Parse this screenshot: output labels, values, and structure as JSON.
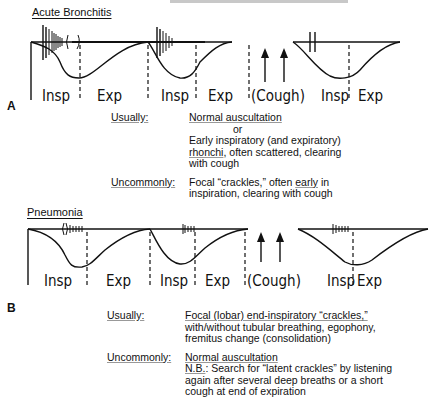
{
  "panelA": {
    "letter": "A",
    "title": "Acute Bronchitis",
    "phases": [
      "Insp",
      "Exp",
      "Insp",
      "Exp",
      "(Cough)",
      "Insp",
      "Exp"
    ],
    "usually_label": "Usually:",
    "usually_line1": "Normal auscultation",
    "usually_or": "or",
    "usually_line2": "Early inspiratory (and expiratory)",
    "usually_line3a": "rhonchi",
    "usually_line3b": ", often scattered, clearing",
    "usually_line4": "with cough",
    "uncommonly_label": "Uncommonly:",
    "uncommonly_line1a": "Focal “crackles,” often ",
    "uncommonly_line1b": "early",
    "uncommonly_line1c": " in",
    "uncommonly_line2": "inspiration, clearing with cough"
  },
  "panelB": {
    "letter": "B",
    "title": "Pneumonia",
    "phases": [
      "Insp",
      "Exp",
      "Insp",
      "Exp",
      "(Cough)",
      "Insp",
      "Exp"
    ],
    "usually_label": "Usually:",
    "usually_line1": "Focal (lobar) end-inspiratory “crackles,”",
    "usually_line2": "with/without tubular breathing, egophony,",
    "usually_line3": "fremitus change (consolidation)",
    "uncommonly_label": "Uncommonly:",
    "uncommonly_line1": "Normal auscultation",
    "uncommonly_line2a": "N.B.",
    "uncommonly_line2b": ": Search for “latent crackles” by listening",
    "uncommonly_line3": "again after several deep breaths or a short",
    "uncommonly_line4": "cough at end of expiration"
  }
}
